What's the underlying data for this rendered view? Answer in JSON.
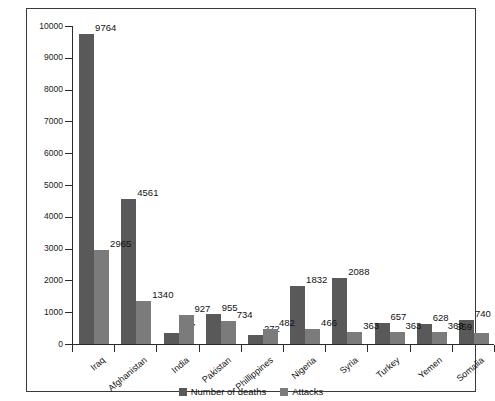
{
  "chart_data": {
    "type": "bar",
    "title": "",
    "xlabel": "",
    "ylabel": "",
    "ylim": [
      0,
      10000
    ],
    "ytick_step": 1000,
    "yticks": [
      "0",
      "1000",
      "2000",
      "3000",
      "4000",
      "5000",
      "6000",
      "7000",
      "8000",
      "9000",
      "10000"
    ],
    "grid": false,
    "legend_position": "bottom-center",
    "categories": [
      "Iraq",
      "Afghanistan",
      "India",
      "Pakistan",
      "Phillippines",
      "Nigeria",
      "Syria",
      "Turkey",
      "Yemen",
      "Somalia"
    ],
    "series": [
      {
        "name": "Number of deaths",
        "color": "#595959",
        "values": [
          9764,
          4561,
          337,
          955,
          272,
          1832,
          2088,
          657,
          628,
          740
        ]
      },
      {
        "name": "Attacks",
        "color": "#7b7b7b",
        "values": [
          2965,
          1340,
          927,
          734,
          482,
          466,
          363,
          363,
          363,
          359
        ]
      }
    ],
    "data_labels": [
      [
        "9764",
        "2965"
      ],
      [
        "4561",
        "1340"
      ],
      [
        "337",
        "927"
      ],
      [
        "955",
        "734"
      ],
      [
        "272",
        "482"
      ],
      [
        "1832",
        "466"
      ],
      [
        "2088",
        "363"
      ],
      [
        "657",
        "363"
      ],
      [
        "628",
        "363"
      ],
      [
        "740",
        "359"
      ]
    ]
  },
  "legend": {
    "items": [
      {
        "label": "Number of deaths",
        "color": "#595959"
      },
      {
        "label": "Attacks",
        "color": "#7b7b7b"
      }
    ]
  },
  "colors": {
    "deaths": "#595959",
    "attacks": "#7b7b7b",
    "axis": "#2b2b2b",
    "frame": "#3a3a3a",
    "background": "#ffffff"
  }
}
